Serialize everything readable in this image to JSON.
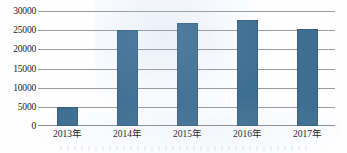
{
  "chart_data": {
    "type": "bar",
    "title": "",
    "subtitle": "",
    "xlabel": "",
    "ylabel": "",
    "categories": [
      "2013年",
      "2014年",
      "2015年",
      "2016年",
      "2017年"
    ],
    "values": [
      5000,
      25000,
      27000,
      27600,
      25400
    ],
    "series": [
      {
        "name": "",
        "values": [
          5000,
          25000,
          27000,
          27600,
          25400
        ]
      }
    ],
    "ylim": [
      0,
      30000
    ],
    "y_ticks": [
      0,
      5000,
      10000,
      15000,
      20000,
      25000,
      30000
    ],
    "y_tick_labels": [
      "0",
      "5000",
      "10000",
      "15000",
      "20000",
      "25000",
      "30000"
    ],
    "grid": true,
    "grid_orientation": "horizontal",
    "legend": false,
    "legend_position": "none",
    "annotations": [],
    "bar_color": "#3e6e91",
    "gridline_color": "#9a9a9a",
    "background_color": "#ffffff",
    "axis_text_color": "#1b1b1b"
  }
}
